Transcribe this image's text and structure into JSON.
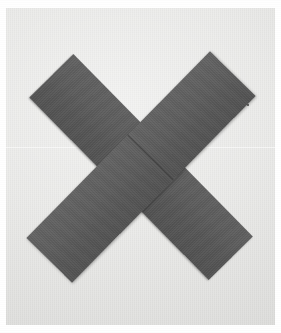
{
  "image": {
    "kind": "photograph",
    "subject": "two crossed dark-gray rectangular strips forming an X",
    "caption": "",
    "width_px": 281,
    "height_px": 333
  },
  "colors": {
    "photo_border": "#ffffff",
    "backdrop": "#e9e9e7",
    "strip_dark": "#525252",
    "strip_mid": "#5a5a5a",
    "strip_light": "#636363",
    "seam_line": "#141414",
    "backdrop_seam": "#ffffff",
    "speck": "#3c3c3c"
  },
  "objects": {
    "backdrop": {
      "name": "light gray studio backdrop",
      "tone": "off-white warm gray"
    },
    "strips": [
      {
        "id": "strip-tl-br",
        "name": "strip running top-left to bottom-right",
        "rotation_deg": 45.5,
        "length_px": 256,
        "width_px": 62,
        "layer": "under",
        "seam_position_pct": 44
      },
      {
        "id": "strip-tr-bl",
        "name": "strip running top-right to bottom-left",
        "rotation_deg": -45.5,
        "length_px": 262,
        "width_px": 64,
        "layer": "over",
        "seam_position_pct": 55
      }
    ],
    "backdrop_seam": {
      "name": "faint horizontal seam across backdrop",
      "y_px": 139
    },
    "speck": {
      "name": "small dark speck on backdrop",
      "x_px": 241,
      "y_px": 96
    }
  }
}
